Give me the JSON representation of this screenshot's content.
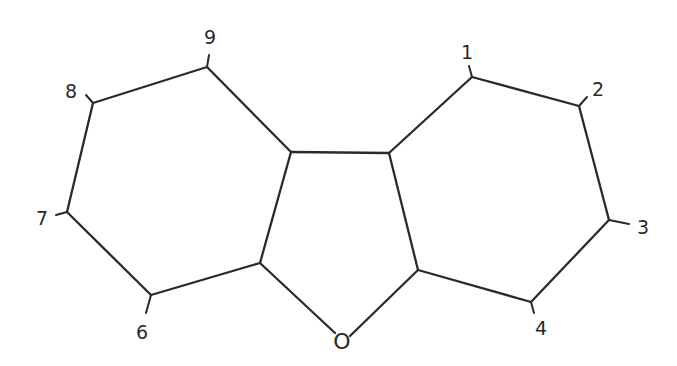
{
  "diagram": {
    "type": "chemical-structure",
    "heteroatom": {
      "symbol": "O",
      "x": 342,
      "y": 341
    },
    "atoms": [
      {
        "id": "C1",
        "label": "1",
        "x": 472,
        "y": 77,
        "label_x": 467,
        "label_y": 52,
        "tick": [
          472,
          77,
          469,
          66
        ]
      },
      {
        "id": "C2",
        "label": "2",
        "x": 579,
        "y": 106,
        "label_x": 598,
        "label_y": 89,
        "tick": [
          579,
          106,
          587,
          97
        ]
      },
      {
        "id": "C3",
        "label": "3",
        "x": 609,
        "y": 220,
        "label_x": 643,
        "label_y": 227,
        "tick": [
          609,
          220,
          629,
          224
        ]
      },
      {
        "id": "C4",
        "label": "4",
        "x": 531,
        "y": 302,
        "label_x": 541,
        "label_y": 328,
        "tick": [
          531,
          302,
          534,
          313
        ]
      },
      {
        "id": "C4a",
        "label": "",
        "x": 418,
        "y": 270
      },
      {
        "id": "C9b",
        "label": "",
        "x": 389,
        "y": 153
      },
      {
        "id": "C9a",
        "label": "",
        "x": 291,
        "y": 152
      },
      {
        "id": "C5a",
        "label": "",
        "x": 260,
        "y": 263
      },
      {
        "id": "C6",
        "label": "6",
        "x": 151,
        "y": 295,
        "label_x": 142,
        "label_y": 332,
        "tick": [
          151,
          295,
          146,
          313
        ]
      },
      {
        "id": "C7",
        "label": "7",
        "x": 67,
        "y": 212,
        "label_x": 42,
        "label_y": 218,
        "tick": [
          67,
          212,
          56,
          215
        ]
      },
      {
        "id": "C8",
        "label": "8",
        "x": 93,
        "y": 103,
        "label_x": 71,
        "label_y": 91,
        "tick": [
          93,
          103,
          86,
          95
        ]
      },
      {
        "id": "C9",
        "label": "9",
        "x": 207,
        "y": 67,
        "label_x": 210,
        "label_y": 37,
        "tick": [
          207,
          67,
          209,
          55
        ]
      }
    ],
    "bonds": [
      [
        "C9",
        "C8"
      ],
      [
        "C8",
        "C7"
      ],
      [
        "C7",
        "C6"
      ],
      [
        "C6",
        "C5a"
      ],
      [
        "C5a",
        "C9a"
      ],
      [
        "C9a",
        "C9"
      ],
      [
        "C9a",
        "C9b"
      ],
      [
        "C9b",
        "C1"
      ],
      [
        "C1",
        "C2"
      ],
      [
        "C2",
        "C3"
      ],
      [
        "C3",
        "C4"
      ],
      [
        "C4",
        "C4a"
      ],
      [
        "C4a",
        "C9b"
      ],
      [
        "C5a",
        "O"
      ],
      [
        "O",
        "C4a"
      ]
    ],
    "colors": {
      "ink": "#2a2a2a",
      "background": "#ffffff"
    }
  },
  "labels": {
    "pos1": "1",
    "pos2": "2",
    "pos3": "3",
    "pos4": "4",
    "pos6": "6",
    "pos7": "7",
    "pos8": "8",
    "pos9": "9",
    "oxygen": "O"
  }
}
